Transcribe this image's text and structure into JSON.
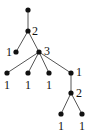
{
  "diagram": {
    "type": "rooted-tree",
    "colors": {
      "node": "#111111",
      "edge": "#555555",
      "label": "#111111"
    },
    "nodes": [
      {
        "id": "root",
        "x": 28,
        "y": 10,
        "label": ""
      },
      {
        "id": "n2a",
        "x": 28,
        "y": 31,
        "label": "2"
      },
      {
        "id": "n1a",
        "x": 16,
        "y": 52,
        "label": "1"
      },
      {
        "id": "n3",
        "x": 39,
        "y": 52,
        "label": "3"
      },
      {
        "id": "l1",
        "x": 7,
        "y": 73,
        "label": "1"
      },
      {
        "id": "l2",
        "x": 28,
        "y": 73,
        "label": "1"
      },
      {
        "id": "l3",
        "x": 49,
        "y": 73,
        "label": "1"
      },
      {
        "id": "n1b",
        "x": 71,
        "y": 73,
        "label": "1"
      },
      {
        "id": "n2b",
        "x": 71,
        "y": 93,
        "label": "2"
      },
      {
        "id": "l4",
        "x": 61,
        "y": 114,
        "label": "1"
      },
      {
        "id": "l5",
        "x": 82,
        "y": 114,
        "label": "1"
      }
    ],
    "edges": [
      [
        "root",
        "n2a"
      ],
      [
        "n2a",
        "n1a"
      ],
      [
        "n2a",
        "n3"
      ],
      [
        "n3",
        "l1"
      ],
      [
        "n3",
        "l2"
      ],
      [
        "n3",
        "l3"
      ],
      [
        "n3",
        "n1b"
      ],
      [
        "n1b",
        "n2b"
      ],
      [
        "n2b",
        "l4"
      ],
      [
        "n2b",
        "l5"
      ]
    ],
    "labels": {
      "n2a": "2",
      "n1a": "1",
      "n3": "3",
      "l1": "1",
      "l2": "1",
      "l3": "1",
      "n1b": "1",
      "n2b": "2",
      "l4": "1",
      "l5": "1"
    }
  }
}
